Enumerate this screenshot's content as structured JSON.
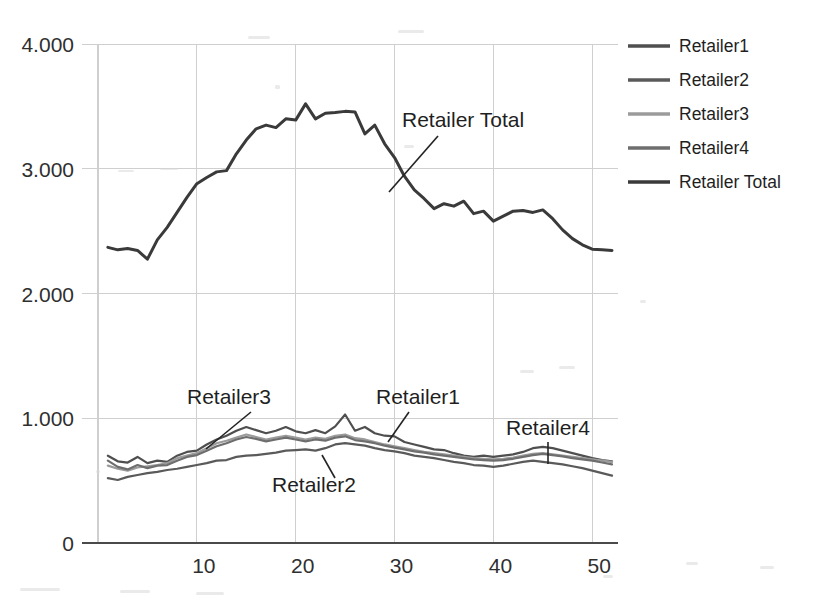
{
  "chart_data": {
    "type": "line",
    "title": "",
    "xlabel": "",
    "ylabel": "",
    "xlim": [
      0,
      52
    ],
    "ylim": [
      0,
      4000
    ],
    "y_ticks": [
      0,
      1000,
      2000,
      3000,
      4000
    ],
    "y_tick_labels": [
      "0",
      "1.000",
      "2.000",
      "3.000",
      "4.000"
    ],
    "x_ticks": [
      10,
      20,
      30,
      40,
      50
    ],
    "x_tick_labels": [
      "10",
      "20",
      "30",
      "40",
      "50"
    ],
    "grid": true,
    "legend_position": "right",
    "x": [
      1,
      2,
      3,
      4,
      5,
      6,
      7,
      8,
      9,
      10,
      11,
      12,
      13,
      14,
      15,
      16,
      17,
      18,
      19,
      20,
      21,
      22,
      23,
      24,
      25,
      26,
      27,
      28,
      29,
      30,
      31,
      32,
      33,
      34,
      35,
      36,
      37,
      38,
      39,
      40,
      41,
      42,
      43,
      44,
      45,
      46,
      47,
      48,
      49,
      50,
      51,
      52
    ],
    "series": [
      {
        "name": "Retailer1",
        "color": "#4f4f4f",
        "values": [
          700,
          655,
          645,
          690,
          640,
          660,
          650,
          700,
          730,
          740,
          790,
          830,
          860,
          900,
          930,
          905,
          880,
          900,
          930,
          895,
          880,
          905,
          880,
          935,
          1030,
          900,
          930,
          880,
          860,
          855,
          810,
          790,
          770,
          750,
          745,
          720,
          700,
          690,
          700,
          690,
          700,
          710,
          730,
          760,
          770,
          760,
          740,
          720,
          700,
          680,
          665,
          655
        ]
      },
      {
        "name": "Retailer2",
        "color": "#5a5a5a",
        "values": [
          520,
          505,
          530,
          545,
          560,
          570,
          585,
          595,
          610,
          625,
          640,
          660,
          665,
          690,
          700,
          705,
          715,
          725,
          740,
          745,
          750,
          740,
          760,
          790,
          800,
          790,
          780,
          760,
          745,
          735,
          720,
          700,
          690,
          680,
          665,
          650,
          640,
          625,
          620,
          610,
          620,
          635,
          650,
          660,
          650,
          640,
          630,
          615,
          600,
          580,
          560,
          540
        ]
      },
      {
        "name": "Retailer3",
        "color": "#9b9b9b",
        "values": [
          620,
          595,
          580,
          605,
          615,
          625,
          640,
          680,
          700,
          720,
          760,
          800,
          820,
          845,
          870,
          850,
          830,
          845,
          860,
          845,
          830,
          845,
          835,
          860,
          870,
          840,
          830,
          810,
          790,
          775,
          760,
          745,
          730,
          720,
          710,
          700,
          690,
          680,
          675,
          670,
          675,
          685,
          700,
          715,
          720,
          710,
          700,
          690,
          680,
          670,
          660,
          650
        ]
      },
      {
        "name": "Retailer4",
        "color": "#6e6e6e",
        "values": [
          660,
          610,
          590,
          625,
          600,
          620,
          625,
          660,
          690,
          705,
          740,
          775,
          800,
          830,
          850,
          835,
          815,
          830,
          845,
          830,
          815,
          830,
          820,
          845,
          855,
          825,
          815,
          800,
          780,
          765,
          750,
          735,
          725,
          710,
          700,
          690,
          680,
          670,
          665,
          660,
          665,
          675,
          690,
          705,
          715,
          705,
          695,
          680,
          670,
          660,
          645,
          630
        ]
      },
      {
        "name": "Retailer Total",
        "color": "#3a3a3a",
        "values": [
          2370,
          2350,
          2360,
          2345,
          2275,
          2430,
          2530,
          2650,
          2770,
          2880,
          2930,
          2975,
          2985,
          3120,
          3230,
          3320,
          3350,
          3330,
          3400,
          3390,
          3520,
          3400,
          3445,
          3450,
          3460,
          3455,
          3280,
          3350,
          3200,
          3090,
          2940,
          2830,
          2760,
          2680,
          2720,
          2700,
          2740,
          2640,
          2660,
          2580,
          2620,
          2660,
          2665,
          2650,
          2670,
          2600,
          2510,
          2440,
          2390,
          2355,
          2350,
          2345
        ]
      }
    ],
    "annotations": [
      {
        "label": "Retailer Total",
        "text_x": 402,
        "text_y": 127,
        "leader": [
          [
            438,
            136
          ],
          [
            389,
            192
          ]
        ]
      },
      {
        "label": "Retailer3",
        "text_x": 187,
        "text_y": 404,
        "leader": [
          [
            251,
            412
          ],
          [
            206,
            449
          ]
        ]
      },
      {
        "label": "Retailer1",
        "text_x": 376,
        "text_y": 404,
        "leader": [
          [
            409,
            412
          ],
          [
            388,
            442
          ]
        ]
      },
      {
        "label": "Retailer2",
        "text_x": 272,
        "text_y": 492,
        "leader": [
          [
            335,
            478
          ],
          [
            322,
            455
          ]
        ]
      },
      {
        "label": "Retailer4",
        "text_x": 506,
        "text_y": 435,
        "leader": [
          [
            548,
            442
          ],
          [
            548,
            464
          ]
        ]
      }
    ]
  },
  "legend": {
    "items": [
      {
        "label": "Retailer1",
        "color": "#4f4f4f",
        "y": 46
      },
      {
        "label": "Retailer2",
        "color": "#5a5a5a",
        "y": 80
      },
      {
        "label": "Retailer3",
        "color": "#9b9b9b",
        "y": 114
      },
      {
        "label": "Retailer4",
        "color": "#6e6e6e",
        "y": 148
      },
      {
        "label": "Retailer Total",
        "color": "#3a3a3a",
        "y": 182
      }
    ]
  },
  "colors": {
    "grid": "#cfcfcf",
    "axis": "#4a4a4a",
    "text": "#2b2b2b",
    "background": "#ffffff"
  }
}
